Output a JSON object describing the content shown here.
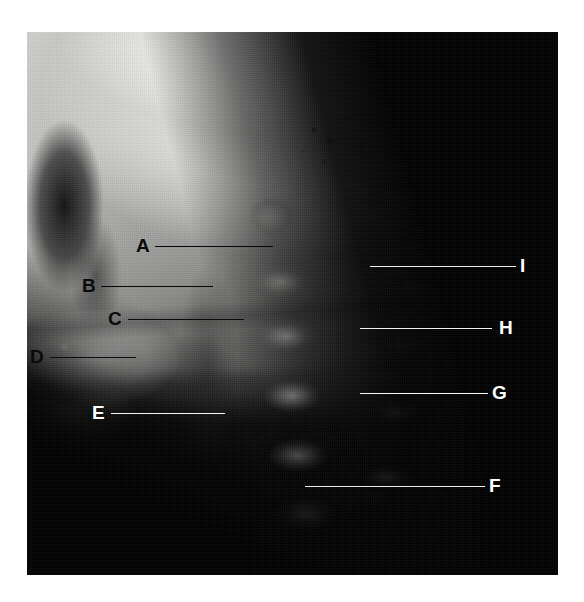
{
  "figure": {
    "kind": "radiograph",
    "modality": "X-ray",
    "view": "lateral cervical spine",
    "background_color": "#ffffff",
    "plate": {
      "x": 27,
      "y": 32,
      "width": 531,
      "height": 543
    }
  },
  "annotations": {
    "style_dark_color": "#0a0a0a",
    "style_light_color": "#ffffff",
    "items": [
      {
        "id": "A",
        "label": "A",
        "style": "dark",
        "label_x": 136,
        "label_y": 236,
        "line_x": 155,
        "line_y": 246,
        "line_width": 118,
        "side": "left"
      },
      {
        "id": "B",
        "label": "B",
        "style": "dark",
        "label_x": 82,
        "label_y": 276,
        "line_x": 101,
        "line_y": 286,
        "line_width": 112,
        "side": "left"
      },
      {
        "id": "C",
        "label": "C",
        "style": "dark",
        "label_x": 108,
        "label_y": 309,
        "line_x": 128,
        "line_y": 319,
        "line_width": 116,
        "side": "left"
      },
      {
        "id": "D",
        "label": "D",
        "style": "dark",
        "label_x": 30,
        "label_y": 347,
        "line_x": 50,
        "line_y": 357,
        "line_width": 86,
        "side": "left"
      },
      {
        "id": "E",
        "label": "E",
        "style": "light",
        "label_x": 92,
        "label_y": 403,
        "line_x": 111,
        "line_y": 413,
        "line_width": 114,
        "side": "left"
      },
      {
        "id": "F",
        "label": "F",
        "style": "light",
        "label_x": 489,
        "label_y": 476,
        "line_x": 305,
        "line_y": 486,
        "line_width": 180,
        "side": "right"
      },
      {
        "id": "G",
        "label": "G",
        "style": "light",
        "label_x": 492,
        "label_y": 383,
        "line_x": 360,
        "line_y": 393,
        "line_width": 128,
        "side": "right"
      },
      {
        "id": "H",
        "label": "H",
        "style": "light",
        "label_x": 499,
        "label_y": 318,
        "line_x": 360,
        "line_y": 328,
        "line_width": 132,
        "side": "right"
      },
      {
        "id": "I",
        "label": "I",
        "style": "light",
        "label_x": 520,
        "label_y": 256,
        "line_x": 370,
        "line_y": 266,
        "line_width": 146,
        "side": "right"
      }
    ]
  }
}
